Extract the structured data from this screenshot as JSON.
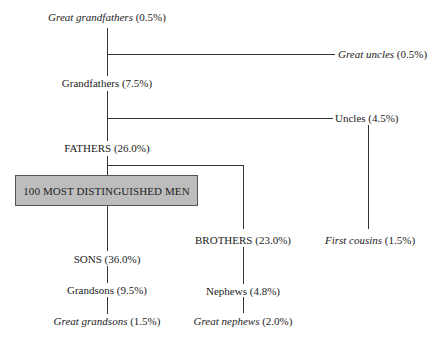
{
  "diagram": {
    "root": {
      "label": "100 MOST DISTINGUISHED MEN"
    },
    "nodes": {
      "great_grandfathers": {
        "name": "Great grandfathers",
        "pct": "(0.5%)",
        "italic": true
      },
      "grandfathers": {
        "name": "Grandfathers",
        "pct": "(7.5%)",
        "italic": false
      },
      "fathers": {
        "name": "FATHERS",
        "pct": "(26.0%)",
        "italic": false
      },
      "great_uncles": {
        "name": "Great uncles",
        "pct": "(0.5%)",
        "italic": true
      },
      "uncles": {
        "name": "Uncles",
        "pct": "(4.5%)",
        "italic": false
      },
      "first_cousins": {
        "name": "First cousins",
        "pct": "(1.5%)",
        "italic": true
      },
      "brothers": {
        "name": "BROTHERS",
        "pct": "(23.0%)",
        "italic": false
      },
      "nephews": {
        "name": "Nephews",
        "pct": "(4.8%)",
        "italic": false
      },
      "great_nephews": {
        "name": "Great nephews",
        "pct": "(2.0%)",
        "italic": true
      },
      "sons": {
        "name": "SONS",
        "pct": "(36.0%)",
        "italic": false
      },
      "grandsons": {
        "name": "Grandsons",
        "pct": "(9.5%)",
        "italic": false
      },
      "great_grandsons": {
        "name": "Great grandsons",
        "pct": "(1.5%)",
        "italic": true
      }
    },
    "edges": [
      [
        "great_grandfathers",
        "grandfathers"
      ],
      [
        "great_grandfathers",
        "great_uncles"
      ],
      [
        "grandfathers",
        "fathers"
      ],
      [
        "grandfathers",
        "uncles"
      ],
      [
        "uncles",
        "first_cousins"
      ],
      [
        "fathers",
        "root"
      ],
      [
        "fathers",
        "brothers"
      ],
      [
        "brothers",
        "nephews"
      ],
      [
        "nephews",
        "great_nephews"
      ],
      [
        "root",
        "sons"
      ],
      [
        "sons",
        "grandsons"
      ],
      [
        "grandsons",
        "great_grandsons"
      ]
    ]
  }
}
